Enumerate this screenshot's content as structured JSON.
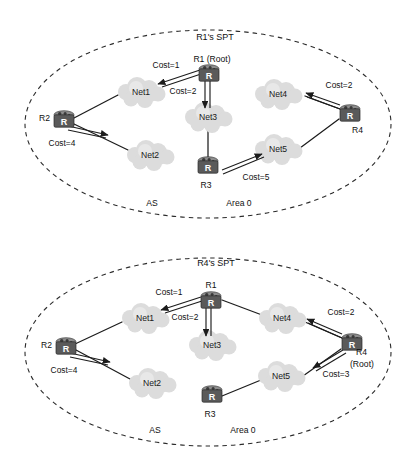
{
  "figure": {
    "background": "#ffffff",
    "accent": "#5a5a5a",
    "cloud_color": "#dcdcdc",
    "line_color": "#1c1c1c"
  },
  "panels": [
    {
      "id": "r1-spt",
      "title": "R1's SPT",
      "region_labels": {
        "as": "AS",
        "area": "Area 0"
      },
      "nodes": {
        "r1": {
          "label": "R1 (Root)",
          "glyph": "R"
        },
        "r2": {
          "label": "R2",
          "glyph": "R"
        },
        "r3": {
          "label": "R3",
          "glyph": "R"
        },
        "r4": {
          "label": "R4",
          "glyph": "R"
        },
        "net1": {
          "label": "Net1"
        },
        "net2": {
          "label": "Net2"
        },
        "net3": {
          "label": "Net3"
        },
        "net4": {
          "label": "Net4"
        },
        "net5": {
          "label": "Net5"
        }
      },
      "costs": {
        "r1_net1": "Cost=1",
        "r1_net3": "Cost=2",
        "r2_net2": "Cost=4",
        "r3_net5": "Cost=5",
        "r4_net4": "Cost=2"
      }
    },
    {
      "id": "r4-spt",
      "title": "R4's SPT",
      "region_labels": {
        "as": "AS",
        "area": "Area 0"
      },
      "nodes": {
        "r1": {
          "label": "R1",
          "glyph": "R"
        },
        "r2": {
          "label": "R2",
          "glyph": "R"
        },
        "r3": {
          "label": "R3",
          "glyph": "R"
        },
        "r4": {
          "label": "R4",
          "label2": "(Root)",
          "glyph": "R"
        },
        "net1": {
          "label": "Net1"
        },
        "net2": {
          "label": "Net2"
        },
        "net3": {
          "label": "Net3"
        },
        "net4": {
          "label": "Net4"
        },
        "net5": {
          "label": "Net5"
        }
      },
      "costs": {
        "r1_net1": "Cost=1",
        "r1_net3": "Cost=2",
        "r2_net2": "Cost=4",
        "r4_net4": "Cost=2",
        "r4_net5": "Cost=3"
      }
    }
  ]
}
